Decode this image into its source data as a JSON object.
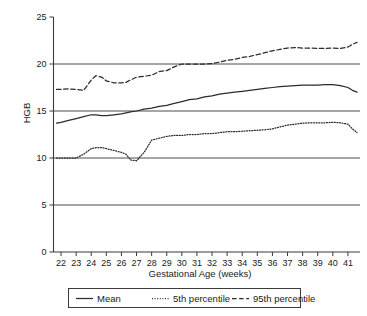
{
  "chart_data": {
    "type": "line",
    "title": "",
    "xlabel": "Gestational Age (weeks)",
    "ylabel": "HGB",
    "xlim": [
      21.5,
      41.8
    ],
    "ylim": [
      0,
      25
    ],
    "yticks": [
      0,
      5,
      10,
      15,
      20,
      25
    ],
    "ytick_labels": [
      "0",
      "5",
      "10",
      "15",
      "20",
      "25"
    ],
    "xticks": [
      22,
      23,
      24,
      25,
      26,
      27,
      28,
      29,
      30,
      31,
      32,
      33,
      34,
      35,
      36,
      37,
      38,
      39,
      40,
      41
    ],
    "xtick_labels": [
      "22",
      "23",
      "24",
      "25",
      "26",
      "27",
      "28",
      "29",
      "30",
      "31",
      "32",
      "33",
      "34",
      "35",
      "36",
      "37",
      "38",
      "39",
      "40",
      "41"
    ],
    "grid": "horizontal-at-5-10-15-20",
    "legend_position": "below-plot",
    "x": [
      21.7,
      22.0,
      22.5,
      23.0,
      23.5,
      24.0,
      24.3,
      24.7,
      25.0,
      25.5,
      26.0,
      26.3,
      26.6,
      27.0,
      27.5,
      28.0,
      28.5,
      29.0,
      29.5,
      30.0,
      30.5,
      31.0,
      31.5,
      32.0,
      32.5,
      33.0,
      33.5,
      34.0,
      34.5,
      35.0,
      35.5,
      36.0,
      36.5,
      37.0,
      37.5,
      38.0,
      38.5,
      39.0,
      39.5,
      40.0,
      40.5,
      41.0,
      41.3,
      41.6
    ],
    "series": [
      {
        "name": "Mean",
        "style": "solid",
        "values": [
          13.7,
          13.8,
          14.0,
          14.2,
          14.4,
          14.6,
          14.6,
          14.5,
          14.5,
          14.6,
          14.7,
          14.8,
          14.9,
          15.0,
          15.2,
          15.3,
          15.5,
          15.6,
          15.8,
          16.0,
          16.2,
          16.3,
          16.5,
          16.6,
          16.8,
          16.9,
          17.0,
          17.1,
          17.2,
          17.3,
          17.4,
          17.5,
          17.6,
          17.65,
          17.7,
          17.75,
          17.75,
          17.75,
          17.8,
          17.8,
          17.7,
          17.5,
          17.2,
          17.0
        ]
      },
      {
        "name": "5th percentile",
        "style": "dotted",
        "values": [
          10.0,
          10.0,
          10.0,
          10.0,
          10.4,
          11.0,
          11.1,
          11.1,
          11.0,
          10.8,
          10.6,
          10.4,
          9.8,
          9.7,
          10.6,
          11.9,
          12.1,
          12.3,
          12.4,
          12.4,
          12.5,
          12.5,
          12.6,
          12.6,
          12.7,
          12.8,
          12.8,
          12.85,
          12.9,
          12.95,
          13.0,
          13.1,
          13.3,
          13.5,
          13.6,
          13.7,
          13.75,
          13.75,
          13.75,
          13.8,
          13.75,
          13.6,
          13.1,
          12.7
        ]
      },
      {
        "name": "95th percentile",
        "style": "dashed",
        "values": [
          17.3,
          17.3,
          17.35,
          17.3,
          17.2,
          18.3,
          18.75,
          18.6,
          18.2,
          18.0,
          18.0,
          18.05,
          18.3,
          18.6,
          18.7,
          18.8,
          19.2,
          19.3,
          19.7,
          20.0,
          20.0,
          20.0,
          20.0,
          20.05,
          20.2,
          20.4,
          20.5,
          20.7,
          20.8,
          21.0,
          21.2,
          21.4,
          21.55,
          21.7,
          21.75,
          21.7,
          21.7,
          21.65,
          21.65,
          21.7,
          21.65,
          21.8,
          22.1,
          22.3
        ]
      }
    ]
  },
  "legend": {
    "items": [
      {
        "label": "Mean",
        "style": "solid"
      },
      {
        "label": "5th percentile",
        "style": "dotted"
      },
      {
        "label": "95th percentile",
        "style": "dashed"
      }
    ]
  },
  "colors": {
    "line": "#2b2b2b",
    "grid": "#4d4d4d",
    "axis": "#3a3a3a",
    "background": "#ffffff"
  }
}
